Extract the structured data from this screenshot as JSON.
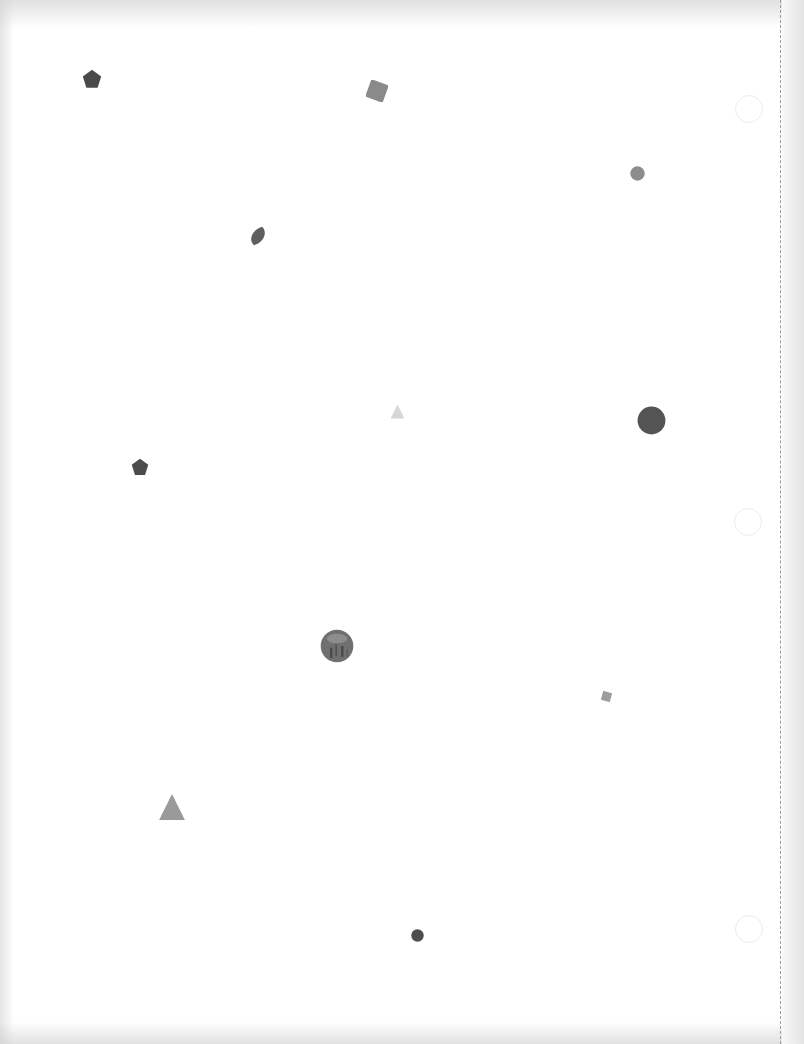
{
  "page": {
    "background": "#ffffff",
    "perforation_color": "#9a9a9a",
    "binder_holes": [
      {
        "x": 735,
        "y": 95
      },
      {
        "x": 734,
        "y": 508
      },
      {
        "x": 735,
        "y": 915
      }
    ]
  },
  "shapes": [
    {
      "kind": "pentagon",
      "x": 82,
      "y": 69,
      "size": 20,
      "color": "#4a4a4a"
    },
    {
      "kind": "square",
      "x": 366,
      "y": 80,
      "size": 22,
      "rotate": 20,
      "color": "#8a8a8a"
    },
    {
      "kind": "circle",
      "x": 630,
      "y": 166,
      "size": 15,
      "color": "#8c8c8c"
    },
    {
      "kind": "leaf",
      "x": 248,
      "y": 226,
      "size": 20,
      "color": "#5f5f5f"
    },
    {
      "kind": "triangle",
      "x": 390,
      "y": 404,
      "size": 15,
      "color": "#d6d6d6"
    },
    {
      "kind": "circle",
      "x": 637,
      "y": 406,
      "size": 29,
      "color": "#545454"
    },
    {
      "kind": "pentagon",
      "x": 131,
      "y": 458,
      "size": 18,
      "color": "#4c4c4c"
    },
    {
      "kind": "textured-circle",
      "x": 320,
      "y": 629,
      "size": 34,
      "color": "#707070"
    },
    {
      "kind": "square",
      "x": 601,
      "y": 691,
      "size": 11,
      "rotate": 15,
      "color": "#9d9d9d"
    },
    {
      "kind": "triangle",
      "x": 158,
      "y": 793,
      "size": 28,
      "color": "#9a9a9a"
    },
    {
      "kind": "circle",
      "x": 411,
      "y": 929,
      "size": 13,
      "color": "#4e4e4e"
    }
  ]
}
